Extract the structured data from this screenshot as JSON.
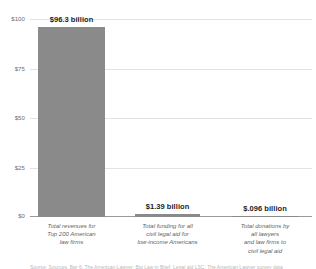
{
  "chart_data": {
    "type": "bar",
    "title": "",
    "subtitle": "",
    "xlabel": "",
    "ylabel": "",
    "ylim": [
      0,
      100
    ],
    "yticks": [
      "$0",
      "$25",
      "$50",
      "$75",
      "$100"
    ],
    "ytick_values": [
      0,
      25,
      50,
      75,
      100
    ],
    "grid": true,
    "legend": "none",
    "units": "billions of US dollars",
    "bar_color": "#8a8a8a",
    "categories": [
      "Total revenues for Top 200 American law firms",
      "Total funding for all civil legal aid for low-income Americans",
      "Total donations by all lawyers and law firms to civil legal aid"
    ],
    "values": [
      96.3,
      1.39,
      0.096
    ],
    "value_labels": [
      "$96.3 billion",
      "$1.39 billion",
      "$.096 billion"
    ],
    "category_lines": [
      [
        "Total revenues for",
        "Top 200 American",
        "law firms"
      ],
      [
        "Total funding for all",
        "civil legal aid for",
        "low-income Americans"
      ],
      [
        "Total donations by",
        "all lawyers",
        "and law firms to",
        "civil legal aid"
      ]
    ]
  },
  "source": {
    "text": "Source: Sources, Bar 6: The American Lawyer; Big Law in Brief; Legal aid LSC; The American Lawyer survey data"
  }
}
